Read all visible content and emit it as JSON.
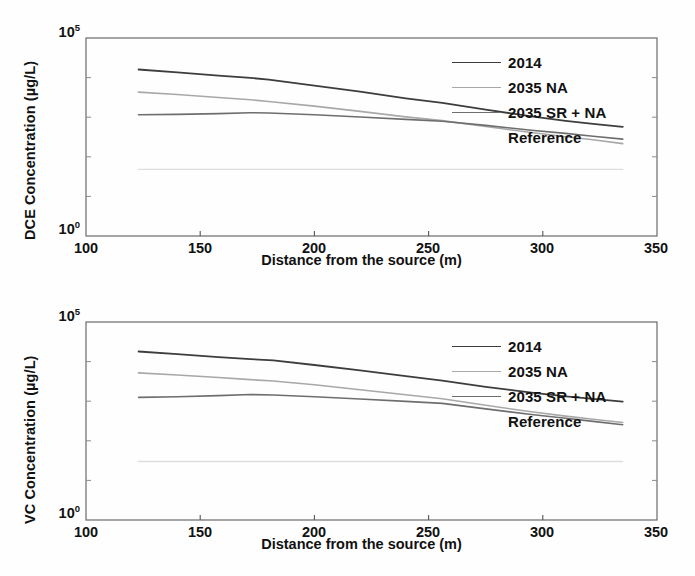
{
  "figure": {
    "background": "#fefefe",
    "panels": [
      "dce",
      "vc"
    ]
  },
  "chart_data": [
    {
      "id": "dce",
      "type": "line",
      "title": "",
      "xlabel": "Distance from the source (m)",
      "ylabel": "DCE Concentration (µg/L)",
      "xlim": [
        100,
        350
      ],
      "ylim": [
        1,
        100000
      ],
      "yscale": "log",
      "xticks": [
        100,
        150,
        200,
        250,
        300,
        350
      ],
      "xticklabels": [
        "100",
        "150",
        "200",
        "250",
        "300",
        "350"
      ],
      "yticks": [
        1,
        100000
      ],
      "yticklabels": [
        "10",
        "10"
      ],
      "ytick_exponents": [
        "0",
        "5"
      ],
      "grid": false,
      "legend_position": "upper right",
      "series": [
        {
          "name": "2014",
          "color": "#3d3d3d",
          "width": 1.8,
          "x": [
            123,
            140,
            158,
            172,
            180,
            200,
            220,
            240,
            256,
            275,
            295,
            310,
            322,
            335
          ],
          "y": [
            16000,
            13500,
            11200,
            9800,
            8900,
            6300,
            4400,
            3000,
            2300,
            1550,
            1050,
            810,
            680,
            570
          ]
        },
        {
          "name": "2035 NA",
          "color": "#a8a8a8",
          "width": 1.6,
          "x": [
            123,
            140,
            158,
            172,
            180,
            200,
            220,
            240,
            256,
            275,
            295,
            310,
            322,
            335
          ],
          "y": [
            4300,
            3750,
            3150,
            2750,
            2500,
            1900,
            1400,
            1020,
            820,
            580,
            410,
            320,
            270,
            215
          ]
        },
        {
          "name": "2035 SR + NA",
          "color": "#6e6e6e",
          "width": 1.6,
          "x": [
            123,
            140,
            158,
            172,
            180,
            200,
            220,
            240,
            256,
            275,
            295,
            310,
            322,
            335
          ],
          "y": [
            1150,
            1180,
            1230,
            1300,
            1280,
            1150,
            1010,
            880,
            790,
            620,
            470,
            390,
            330,
            280
          ]
        },
        {
          "name": "Reference",
          "color": "#dedede",
          "width": 1.4,
          "x": [
            123,
            335
          ],
          "y": [
            48,
            48
          ]
        }
      ]
    },
    {
      "id": "vc",
      "type": "line",
      "title": "",
      "xlabel": "Distance from the source (m)",
      "ylabel": "VC Concentration (µg/L)",
      "xlim": [
        100,
        350
      ],
      "ylim": [
        1,
        100000
      ],
      "yscale": "log",
      "xticks": [
        100,
        150,
        200,
        250,
        300,
        350
      ],
      "xticklabels": [
        "100",
        "150",
        "200",
        "250",
        "300",
        "350"
      ],
      "yticks": [
        1,
        100000
      ],
      "yticklabels": [
        "10",
        "10"
      ],
      "ytick_exponents": [
        "0",
        "5"
      ],
      "grid": false,
      "legend_position": "upper right",
      "series": [
        {
          "name": "2014",
          "color": "#3d3d3d",
          "width": 1.8,
          "x": [
            123,
            140,
            158,
            172,
            182,
            200,
            220,
            240,
            256,
            275,
            295,
            310,
            322,
            335
          ],
          "y": [
            18000,
            15500,
            13000,
            11500,
            10800,
            8200,
            6000,
            4300,
            3300,
            2300,
            1650,
            1330,
            1150,
            980
          ]
        },
        {
          "name": "2035 NA",
          "color": "#a8a8a8",
          "width": 1.6,
          "x": [
            123,
            140,
            158,
            172,
            182,
            200,
            220,
            240,
            256,
            275,
            295,
            310,
            322,
            335
          ],
          "y": [
            5200,
            4600,
            3950,
            3500,
            3250,
            2600,
            1950,
            1450,
            1150,
            790,
            540,
            420,
            350,
            290
          ]
        },
        {
          "name": "2035 SR + NA",
          "color": "#6e6e6e",
          "width": 1.6,
          "x": [
            123,
            140,
            158,
            172,
            182,
            200,
            220,
            240,
            256,
            275,
            295,
            310,
            322,
            335
          ],
          "y": [
            1250,
            1300,
            1380,
            1470,
            1440,
            1300,
            1140,
            990,
            880,
            640,
            460,
            370,
            310,
            255
          ]
        },
        {
          "name": "Reference",
          "color": "#dedede",
          "width": 1.4,
          "x": [
            123,
            335
          ],
          "y": [
            30,
            30
          ]
        }
      ]
    }
  ],
  "legend": {
    "entries": [
      {
        "label": "2014",
        "color": "#3d3d3d",
        "has_line": true
      },
      {
        "label": "2035 NA",
        "color": "#a8a8a8",
        "has_line": true
      },
      {
        "label": "2035 SR + NA",
        "color": "#6e6e6e",
        "has_line": true
      },
      {
        "label": "Reference",
        "color": "#ededed",
        "has_line": false
      }
    ]
  }
}
